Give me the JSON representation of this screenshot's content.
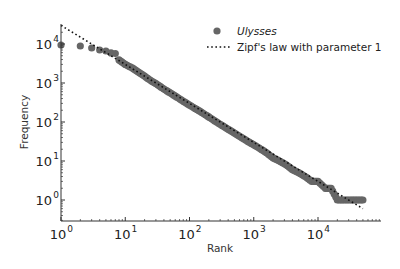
{
  "chart_data": {
    "type": "scatter",
    "title": "",
    "xlabel": "Rank",
    "ylabel": "Frequency",
    "xscale": "log",
    "yscale": "log",
    "xlim": [
      1,
      80000
    ],
    "ylim": [
      0.3,
      40000
    ],
    "grid": false,
    "legend_position": "upper right",
    "x_ticks": [
      {
        "base": "10",
        "exp": "0",
        "value": 1
      },
      {
        "base": "10",
        "exp": "1",
        "value": 10
      },
      {
        "base": "10",
        "exp": "2",
        "value": 100
      },
      {
        "base": "10",
        "exp": "3",
        "value": 1000
      },
      {
        "base": "10",
        "exp": "4",
        "value": 10000
      }
    ],
    "y_ticks": [
      {
        "base": "10",
        "exp": "0",
        "value": 1
      },
      {
        "base": "10",
        "exp": "1",
        "value": 10
      },
      {
        "base": "10",
        "exp": "2",
        "value": 100
      },
      {
        "base": "10",
        "exp": "3",
        "value": 1000
      },
      {
        "base": "10",
        "exp": "4",
        "value": 10000
      }
    ],
    "series": [
      {
        "name": "Ulysses",
        "kind": "scatter",
        "color": "#666666",
        "x": [
          1,
          2,
          3,
          4,
          5,
          6,
          7,
          8,
          10,
          13,
          16,
          20,
          25,
          32,
          40,
          50,
          63,
          80,
          100,
          130,
          160,
          200,
          250,
          320,
          400,
          500,
          630,
          800,
          1000,
          1300,
          1600,
          2000,
          2500,
          3200,
          4000,
          5000,
          6300,
          8000,
          10000,
          13000,
          16000,
          20000,
          25000,
          32000,
          40000,
          50000
        ],
        "values": [
          9400,
          8900,
          7900,
          7000,
          6600,
          5900,
          5700,
          3900,
          3000,
          2400,
          1900,
          1500,
          1150,
          900,
          700,
          560,
          440,
          340,
          270,
          210,
          170,
          135,
          105,
          82,
          65,
          52,
          41,
          32,
          26,
          20,
          16,
          12,
          10,
          8,
          6,
          5,
          4,
          3,
          3,
          2,
          2,
          1,
          1,
          1,
          1,
          1
        ]
      },
      {
        "name": "Zipf's law with parameter 1",
        "kind": "line",
        "style": "dotted",
        "color": "#111111",
        "parameter": 1,
        "x": [
          1,
          50000
        ],
        "values": [
          30000,
          0.6
        ]
      }
    ]
  },
  "legend": {
    "items": [
      {
        "label": "Ulysses",
        "italic": true
      },
      {
        "label": "Zipf's law with parameter 1",
        "italic": false
      }
    ]
  },
  "axes": {
    "xlabel": "Rank",
    "ylabel": "Frequency"
  }
}
